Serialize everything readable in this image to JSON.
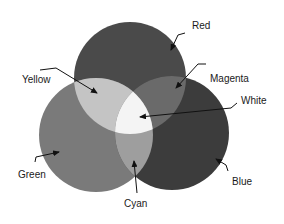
{
  "diagram": {
    "type": "additive-color-venn",
    "circles": [
      {
        "name": "Red",
        "cx": 130,
        "cy": 78,
        "r": 56,
        "fill": "#4a4a4a"
      },
      {
        "name": "Green",
        "cx": 96,
        "cy": 135,
        "r": 57,
        "fill": "#7a7a7a"
      },
      {
        "name": "Blue",
        "cx": 172,
        "cy": 133,
        "r": 57,
        "fill": "#3c3c3c"
      }
    ],
    "overlaps": {
      "yellow_fill": "#c4c4c4",
      "magenta_fill": "#6a6a6a",
      "cyan_fill": "#9e9e9e",
      "white_fill": "#f4f4f4"
    },
    "labels": {
      "red": "Red",
      "yellow": "Yellow",
      "magenta": "Magenta",
      "white": "White",
      "green": "Green",
      "blue": "Blue",
      "cyan": "Cyan"
    }
  }
}
